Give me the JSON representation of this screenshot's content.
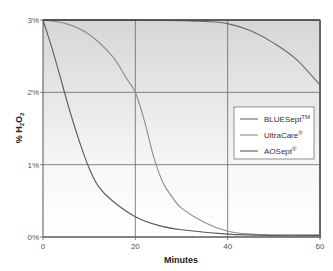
{
  "chart_data": {
    "type": "line",
    "title": "",
    "xlabel": "Minutes",
    "ylabel": "% H2O2",
    "ylabel_parts": {
      "prefix": "% H",
      "sub1": "2",
      "mid": "O",
      "sub2": "2"
    },
    "xlim": [
      0,
      60
    ],
    "ylim": [
      0,
      3
    ],
    "x_ticks": [
      0,
      20,
      40,
      60
    ],
    "x_tick_labels": [
      "0",
      "20",
      "40",
      "60"
    ],
    "y_ticks": [
      0,
      1,
      2,
      3
    ],
    "y_tick_labels": [
      "0%",
      "1%",
      "2%",
      "3%"
    ],
    "grid": true,
    "legend_position": "right-middle",
    "series": [
      {
        "name": "BLUESept™",
        "label": "BLUESept",
        "mark": "TM",
        "color": "#6a6a6a",
        "x": [
          0,
          10,
          20,
          30,
          35,
          40,
          45,
          50,
          55,
          60
        ],
        "y": [
          3.0,
          3.0,
          3.0,
          2.99,
          2.98,
          2.95,
          2.85,
          2.68,
          2.45,
          2.1
        ]
      },
      {
        "name": "UltraCare®",
        "label": "UltraCare",
        "mark": "®",
        "color": "#8c8c8c",
        "x": [
          0,
          5,
          10,
          15,
          18,
          20,
          22,
          24,
          26,
          28,
          30,
          35,
          40,
          45,
          50,
          60
        ],
        "y": [
          3.0,
          2.95,
          2.8,
          2.5,
          2.2,
          2.0,
          1.6,
          1.1,
          0.75,
          0.55,
          0.4,
          0.2,
          0.08,
          0.04,
          0.03,
          0.03
        ]
      },
      {
        "name": "AOSept®",
        "label": "AOSept",
        "mark": "®",
        "color": "#5a5a5a",
        "x": [
          0,
          2,
          4,
          6,
          8,
          10,
          12,
          15,
          20,
          25,
          30,
          40,
          50,
          60
        ],
        "y": [
          3.0,
          2.6,
          2.15,
          1.7,
          1.3,
          0.95,
          0.7,
          0.5,
          0.28,
          0.16,
          0.1,
          0.04,
          0.02,
          0.02
        ]
      }
    ]
  }
}
